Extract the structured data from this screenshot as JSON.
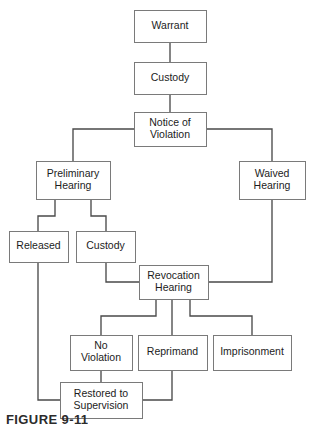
{
  "figure": {
    "caption": "FIGURE 9-11",
    "type": "flowchart"
  },
  "style": {
    "box_fill": "#ffffff",
    "box_stroke": "#7a7a7a",
    "connector_stroke": "#4a4a4a",
    "text_color": "#1c1c1c",
    "background": "#ffffff"
  },
  "nodes": [
    {
      "id": "warrant",
      "label": "Warrant",
      "lines": [
        "Warrant"
      ],
      "x": 134,
      "y": 10,
      "w": 72,
      "h": 32
    },
    {
      "id": "custody_top",
      "label": "Custody",
      "lines": [
        "Custody"
      ],
      "x": 134,
      "y": 62,
      "w": 72,
      "h": 32
    },
    {
      "id": "notice",
      "label": "Notice of Violation",
      "lines": [
        "Notice of",
        "Violation"
      ],
      "x": 134,
      "y": 112,
      "w": 72,
      "h": 34
    },
    {
      "id": "prelim",
      "label": "Preliminary Hearing",
      "lines": [
        "Preliminary",
        "Hearing"
      ],
      "x": 36,
      "y": 161,
      "w": 74,
      "h": 38
    },
    {
      "id": "waived",
      "label": "Waived Hearing",
      "lines": [
        "Waived",
        "Hearing"
      ],
      "x": 239,
      "y": 161,
      "w": 66,
      "h": 38
    },
    {
      "id": "released",
      "label": "Released",
      "lines": [
        "Released"
      ],
      "x": 9,
      "y": 231,
      "w": 59,
      "h": 31
    },
    {
      "id": "custody_low",
      "label": "Custody",
      "lines": [
        "Custody"
      ],
      "x": 76,
      "y": 231,
      "w": 59,
      "h": 31
    },
    {
      "id": "revocation",
      "label": "Revocation Hearing",
      "lines": [
        "Revocation",
        "Hearing"
      ],
      "x": 139,
      "y": 265,
      "w": 69,
      "h": 34
    },
    {
      "id": "noviolation",
      "label": "No Violation",
      "lines": [
        "No",
        "Violation"
      ],
      "x": 70,
      "y": 335,
      "w": 62,
      "h": 35
    },
    {
      "id": "reprimand",
      "label": "Reprimand",
      "lines": [
        "Reprimand"
      ],
      "x": 138,
      "y": 335,
      "w": 69,
      "h": 35
    },
    {
      "id": "imprisonment",
      "label": "Imprisonment",
      "lines": [
        "Imprisonment"
      ],
      "x": 213,
      "y": 335,
      "w": 78,
      "h": 35
    },
    {
      "id": "restored",
      "label": "Restored to Supervision",
      "lines": [
        "Restored to",
        "Supervision"
      ],
      "x": 60,
      "y": 382,
      "w": 82,
      "h": 36
    }
  ],
  "edges": [
    {
      "id": "warrant-to-custody",
      "from": "warrant",
      "to": "custody_top",
      "path": "M170,42 L170,62"
    },
    {
      "id": "custody-to-notice",
      "from": "custody_top",
      "to": "notice",
      "path": "M170,94 L170,112"
    },
    {
      "id": "notice-to-prelim",
      "from": "notice",
      "to": "prelim",
      "path": "M134,129 L73,129 L73,161"
    },
    {
      "id": "notice-to-waived",
      "from": "notice",
      "to": "waived",
      "path": "M206,129 L272,129 L272,161"
    },
    {
      "id": "prelim-to-released",
      "from": "prelim",
      "to": "released",
      "path": "M55,199 L55,216 L38,216 L38,231"
    },
    {
      "id": "prelim-to-custody-low",
      "from": "prelim",
      "to": "custody_low",
      "path": "M91,199 L91,216 L106,216 L106,231"
    },
    {
      "id": "custody-low-to-revocation",
      "from": "custody_low",
      "to": "revocation",
      "path": "M106,262 L106,282 L139,282"
    },
    {
      "id": "waived-to-revocation",
      "from": "waived",
      "to": "revocation",
      "path": "M272,199 L272,282 L208,282"
    },
    {
      "id": "revocation-to-noviolation",
      "from": "revocation",
      "to": "noviolation",
      "path": "M156,299 L156,316 L101,316 L101,335"
    },
    {
      "id": "revocation-to-reprimand",
      "from": "revocation",
      "to": "reprimand",
      "path": "M172,299 L172,335"
    },
    {
      "id": "revocation-to-imprisonment",
      "from": "revocation",
      "to": "imprisonment",
      "path": "M190,299 L190,316 L252,316 L252,335"
    },
    {
      "id": "noviolation-to-restored",
      "from": "noviolation",
      "to": "restored",
      "path": "M101,370 L101,382"
    },
    {
      "id": "reprimand-to-restored",
      "from": "reprimand",
      "to": "restored",
      "path": "M172,370 L172,400 L142,400"
    },
    {
      "id": "released-to-restored",
      "from": "released",
      "to": "restored",
      "path": "M38,262 L38,400 L60,400"
    }
  ]
}
